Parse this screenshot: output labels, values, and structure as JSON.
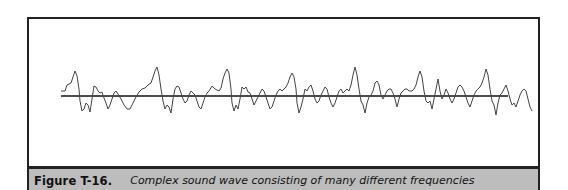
{
  "figure": {
    "label": "Figure T-16.",
    "caption": "Complex sound wave consisting of many different frequencies"
  },
  "diagram": {
    "type": "waveform",
    "baseline_visible": true,
    "colors": {
      "wave": "#444444",
      "baseline": "#111111",
      "caption_background": "#bdbdbd",
      "frame": "#222222"
    }
  }
}
